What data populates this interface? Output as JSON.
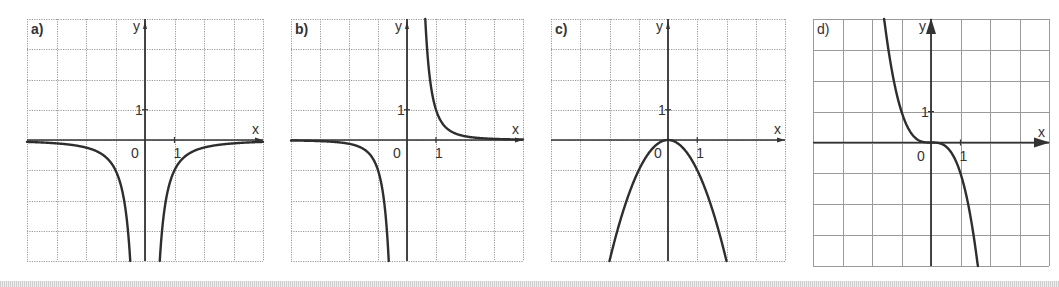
{
  "figure": {
    "grid_cells_x": 8,
    "grid_cells_y": 8,
    "colors": {
      "background": "#ffffff",
      "grid": "#9a9a9a",
      "axis": "#333333",
      "curve": "#2e2e2e",
      "text": "#333333"
    }
  },
  "chart_data": [
    {
      "type": "line",
      "panel_label": "a)",
      "title": "",
      "xlabel": "x",
      "ylabel": "y",
      "tick_labels": {
        "origin": "0",
        "x_unit": "1",
        "y_unit": "1"
      },
      "xlim": [
        -4,
        4
      ],
      "ylim": [
        -4,
        4
      ],
      "grid": true,
      "function": "y = -1/x^2",
      "series": [
        {
          "name": "left branch",
          "x": [
            -4,
            -3,
            -2,
            -1.5,
            -1,
            -0.75,
            -0.5
          ],
          "y": [
            -0.0625,
            -0.111,
            -0.25,
            -0.444,
            -1,
            -1.778,
            -4
          ]
        },
        {
          "name": "right branch",
          "x": [
            0.5,
            0.75,
            1,
            1.5,
            2,
            3,
            4
          ],
          "y": [
            -4,
            -1.778,
            -1,
            -0.444,
            -0.25,
            -0.111,
            -0.0625
          ]
        }
      ],
      "box": {
        "left": 27,
        "top": 19,
        "width": 236,
        "height": 242
      },
      "axis_arrows": false
    },
    {
      "type": "line",
      "panel_label": "b)",
      "title": "",
      "xlabel": "x",
      "ylabel": "y",
      "tick_labels": {
        "origin": "0",
        "x_unit": "1",
        "y_unit": "1"
      },
      "xlim": [
        -4,
        4
      ],
      "ylim": [
        -4,
        4
      ],
      "grid": true,
      "function": "y = 1/x^3",
      "series": [
        {
          "name": "left branch",
          "x": [
            -4,
            -3,
            -2,
            -1.5,
            -1,
            -0.8,
            -0.63
          ],
          "y": [
            -0.0156,
            -0.037,
            -0.125,
            -0.296,
            -1,
            -1.953,
            -4
          ]
        },
        {
          "name": "right branch",
          "x": [
            0.63,
            0.8,
            1,
            1.5,
            2,
            3,
            4
          ],
          "y": [
            4,
            1.953,
            1,
            0.296,
            0.125,
            0.037,
            0.0156
          ]
        }
      ],
      "box": {
        "left": 291,
        "top": 19,
        "width": 232,
        "height": 242
      },
      "axis_arrows": false
    },
    {
      "type": "line",
      "panel_label": "c)",
      "title": "",
      "xlabel": "x",
      "ylabel": "y",
      "tick_labels": {
        "origin": "0",
        "x_unit": "1",
        "y_unit": "1"
      },
      "xlim": [
        -4,
        4
      ],
      "ylim": [
        -4,
        4
      ],
      "grid": true,
      "function": "y = -x^2",
      "series": [
        {
          "name": "parabola",
          "x": [
            -2,
            -1.5,
            -1,
            -0.5,
            0,
            0.5,
            1,
            1.5,
            2
          ],
          "y": [
            -4,
            -2.25,
            -1,
            -0.25,
            0,
            -0.25,
            -1,
            -2.25,
            -4
          ]
        }
      ],
      "box": {
        "left": 551,
        "top": 19,
        "width": 234,
        "height": 242
      },
      "axis_arrows": false
    },
    {
      "type": "line",
      "panel_label": "d)",
      "title": "",
      "xlabel": "x",
      "ylabel": "y",
      "tick_labels": {
        "origin": "0",
        "x_unit": "1",
        "y_unit": "1"
      },
      "xlim": [
        -4,
        4
      ],
      "ylim": [
        -4,
        4
      ],
      "grid": true,
      "function": "y = -x^3",
      "series": [
        {
          "name": "cubic",
          "x": [
            -1.59,
            -1.5,
            -1,
            -0.5,
            0,
            0.5,
            1,
            1.5,
            1.59
          ],
          "y": [
            4,
            3.375,
            1,
            0.125,
            0,
            -0.125,
            -1,
            -3.375,
            -4
          ]
        }
      ],
      "box": {
        "left": 813,
        "top": 19,
        "width": 236,
        "height": 247
      },
      "axis_arrows": true
    }
  ]
}
